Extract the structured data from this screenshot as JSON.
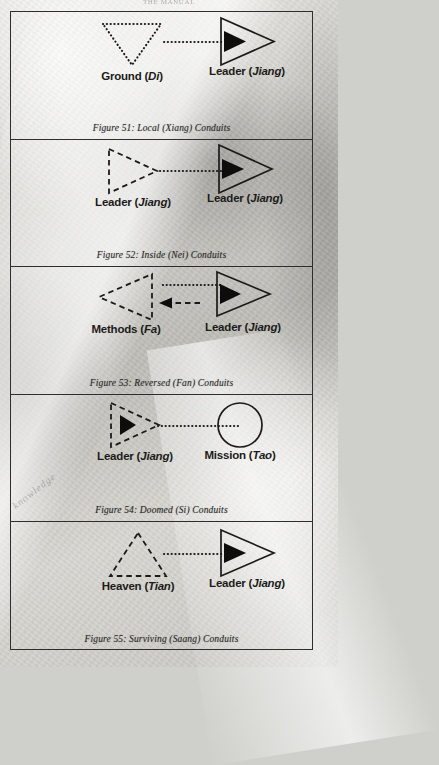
{
  "page": {
    "running_header": "THE MANUAL"
  },
  "figures": [
    {
      "id": "figure-51",
      "caption": "Figure 51: Local (Xiang) Conduits",
      "left_node": {
        "label_main": "Ground (",
        "label_italic": "Di",
        "label_close": ")",
        "shape": "triangle-down-dotted"
      },
      "right_node": {
        "label_main": "Leader (",
        "label_italic": "Jiang",
        "label_close": ")",
        "shape": "triangle-right-solid-with-arrowhead"
      },
      "connector": "dotted-line-left-to-right"
    },
    {
      "id": "figure-52",
      "caption": "Figure 52: Inside (Nei) Conduits",
      "left_node": {
        "label_main": "Leader (",
        "label_italic": "Jiang",
        "label_close": ")",
        "shape": "triangle-right-dashed"
      },
      "right_node": {
        "label_main": "Leader (",
        "label_italic": "Jiang",
        "label_close": ")",
        "shape": "triangle-right-solid-with-arrowhead"
      },
      "connector": "dotted-line-left-to-right"
    },
    {
      "id": "figure-53",
      "caption": "Figure 53: Reversed (Fan) Conduits",
      "left_node": {
        "label_main": "Methods (",
        "label_italic": "Fa",
        "label_close": ")",
        "shape": "triangle-left-dashed"
      },
      "right_node": {
        "label_main": "Leader (",
        "label_italic": "Jiang",
        "label_close": ")",
        "shape": "triangle-right-solid-with-arrowhead"
      },
      "connector": "dotted-line-above-and-dashed-arrow-left-below"
    },
    {
      "id": "figure-54",
      "caption": "Figure 54: Doomed (Si) Conduits",
      "left_node": {
        "label_main": "Leader (",
        "label_italic": "Jiang",
        "label_close": ")",
        "shape": "triangle-right-dashed-with-left-arrowhead"
      },
      "right_node": {
        "label_main": "Mission (",
        "label_italic": "Tao",
        "label_close": ")",
        "shape": "circle-solid"
      },
      "connector": "dotted-line-right-to-left"
    },
    {
      "id": "figure-55",
      "caption": "Figure 55: Surviving (Saang) Conduits",
      "left_node": {
        "label_main": "Heaven (",
        "label_italic": "Tian",
        "label_close": ")",
        "shape": "triangle-up-dashed"
      },
      "right_node": {
        "label_main": "Leader (",
        "label_italic": "Jiang",
        "label_close": ")",
        "shape": "triangle-right-solid-with-arrowhead"
      },
      "connector": "dotted-line-left-to-right"
    }
  ],
  "watermark": {
    "text": "knowledge"
  },
  "colors": {
    "ink": "#1c1b19",
    "frame": "#2f2e2c",
    "paper": "#d6d5d0"
  }
}
